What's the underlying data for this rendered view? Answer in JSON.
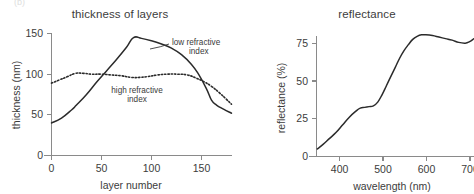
{
  "figure": {
    "background": "#ffffff",
    "ink_color": "#2b2b2b",
    "axis_color": "#8a8a8a",
    "ghost_text": "(b)"
  },
  "panels": [
    {
      "id": "thickness-of-layers",
      "title": "thickness of layers",
      "annotations": [
        {
          "id": "low-refractive-index",
          "line1": "low refractive",
          "line2": "index"
        },
        {
          "id": "high-refractive-index",
          "line1": "high refractive",
          "line2": "index"
        }
      ]
    },
    {
      "id": "reflectance",
      "title": "reflectance"
    }
  ],
  "chart_data": [
    {
      "type": "line",
      "id": "thickness-of-layers",
      "title": "thickness of layers",
      "xlabel": "layer number",
      "ylabel": "thickness (nm)",
      "xlim": [
        0,
        180
      ],
      "ylim": [
        0,
        150
      ],
      "xticks": [
        0,
        50,
        100,
        150
      ],
      "xtick_labels": [
        "0",
        "50",
        "100",
        "150"
      ],
      "yticks": [
        0,
        50,
        100,
        150
      ],
      "ytick_labels": [
        "0",
        "50",
        "100",
        "150"
      ],
      "grid": false,
      "legend": "inline-annotations",
      "series": [
        {
          "name": "low refractive index",
          "style": "solid",
          "x": [
            0,
            10,
            20,
            25,
            35,
            45,
            55,
            65,
            75,
            82,
            90,
            100,
            110,
            120,
            130,
            140,
            147,
            155,
            160,
            165,
            172,
            180
          ],
          "values": [
            40,
            46,
            56,
            62,
            75,
            90,
            104,
            118,
            133,
            145,
            144,
            141,
            137,
            132,
            124,
            112,
            100,
            82,
            68,
            62,
            57,
            52
          ]
        },
        {
          "name": "high refractive index",
          "style": "dotted",
          "x": [
            0,
            8,
            16,
            24,
            32,
            40,
            50,
            60,
            70,
            80,
            88,
            96,
            106,
            116,
            126,
            136,
            145,
            152,
            160,
            168,
            175,
            180
          ],
          "values": [
            89,
            93,
            97,
            101,
            101,
            100,
            100,
            99,
            98,
            96,
            96,
            97,
            99,
            100,
            100,
            99,
            95,
            91,
            85,
            77,
            69,
            63
          ]
        }
      ]
    },
    {
      "type": "line",
      "id": "reflectance",
      "title": "reflectance",
      "xlabel": "wavelength (nm)",
      "ylabel": "reflectance (%)",
      "xlim": [
        350,
        715
      ],
      "ylim": [
        0,
        88
      ],
      "xticks": [
        400,
        500,
        600,
        700
      ],
      "xtick_labels": [
        "400",
        "500",
        "600",
        "700"
      ],
      "yticks": [
        0,
        25,
        50,
        75
      ],
      "ytick_labels": [
        "0",
        "25",
        "50",
        "75"
      ],
      "grid": false,
      "series": [
        {
          "name": "reflectance",
          "style": "solid",
          "x": [
            352,
            365,
            380,
            395,
            410,
            425,
            440,
            450,
            460,
            470,
            480,
            490,
            500,
            510,
            520,
            530,
            540,
            550,
            560,
            570,
            580,
            590,
            600,
            615,
            630,
            645,
            660,
            675,
            690,
            700,
            710,
            715
          ],
          "values": [
            5,
            8,
            12,
            16,
            21,
            26,
            30,
            32,
            32.5,
            33,
            33.5,
            36,
            41,
            47,
            53,
            59,
            65,
            70,
            74,
            77.5,
            79.5,
            80.5,
            80.5,
            80,
            79,
            78,
            77,
            75.5,
            75,
            76,
            78,
            79
          ]
        }
      ]
    }
  ]
}
